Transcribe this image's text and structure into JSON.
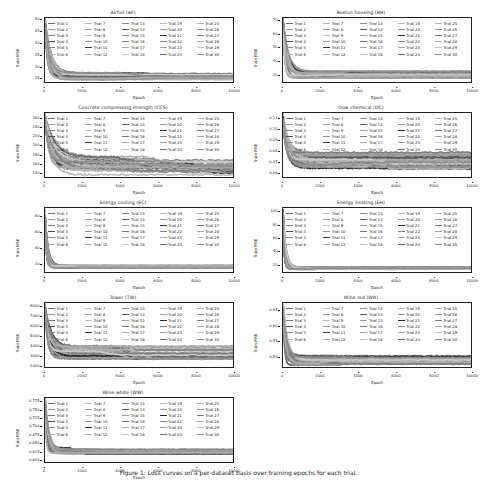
{
  "figure": {
    "caption": "Figure 1: Loss curves on a per-dataset basis over training epochs for each trial.",
    "xlabel": "Epoch",
    "ylabel": "Train MSE",
    "xticks": [
      "0",
      "2000",
      "4000",
      "6000",
      "8000",
      "10000"
    ],
    "xlim": [
      0,
      10000
    ],
    "legend_labels": [
      "Trial 1",
      "Trial 2",
      "Trial 3",
      "Trial 4",
      "Trial 5",
      "Trial 6",
      "Trial 7",
      "Trial 8",
      "Trial 9",
      "Trial 10",
      "Trial 11",
      "Trial 12",
      "Trial 13",
      "Trial 14",
      "Trial 15",
      "Trial 16",
      "Trial 17",
      "Trial 18",
      "Trial 19",
      "Trial 20",
      "Trial 21",
      "Trial 22",
      "Trial 23",
      "Trial 24",
      "Trial 25",
      "Trial 26",
      "Trial 27",
      "Trial 28",
      "Trial 29",
      "Trial 30"
    ],
    "legend_colors": [
      "#6b6b6b",
      "#9a9a9a",
      "#7d7d7d",
      "#4f4f4f",
      "#8c8c8c",
      "#aeaeae",
      "#b8b8b8",
      "#a0a0a0",
      "#c0c0c0",
      "#969696",
      "#3c3c3c",
      "#b0b0b0",
      "#8a8a8a",
      "#5a5a5a",
      "#9e9e9e",
      "#7a7a7a",
      "#a8a8a8",
      "#c4c4c4",
      "#bdbdbd",
      "#9b9b9b",
      "#2e2e2e",
      "#878787",
      "#a5a5a5",
      "#6f6f6f",
      "#b4b4b4",
      "#989898",
      "#7f7f7f",
      "#ababab",
      "#c8c8c8",
      "#8e8e8e"
    ]
  },
  "chart_data": [
    {
      "type": "line",
      "title": "Airfoil (AF)",
      "xlabel": "Epoch",
      "ylabel": "Train MSE",
      "xlim": [
        0,
        10000
      ],
      "ylim": [
        23,
        51
      ],
      "yticks": [
        "50",
        "45",
        "40",
        "35",
        "30",
        "25"
      ],
      "ytickvals": [
        50,
        45,
        40,
        35,
        30,
        25
      ],
      "grid": false,
      "legend_position": "upper center",
      "series_count": 30,
      "start_value": 50,
      "plateau_value": 25.5,
      "plateau_spread": 1.6,
      "decay_epochs": 180,
      "late_drop_epoch": 4200,
      "late_drop_value": 25.2
    },
    {
      "type": "line",
      "title": "Boston housing (BH)",
      "xlabel": "Epoch",
      "ylabel": "Train MSE",
      "xlim": [
        0,
        10000
      ],
      "ylim": [
        24,
        72
      ],
      "yticks": [
        "70",
        "60",
        "50",
        "40",
        "30"
      ],
      "ytickvals": [
        70,
        60,
        50,
        40,
        30
      ],
      "grid": false,
      "legend_position": "upper center",
      "series_count": 30,
      "start_value": 70,
      "plateau_value": 29.5,
      "plateau_spread": 2.5,
      "decay_epochs": 150,
      "late_drop_epoch": 3000,
      "late_drop_value": 28.5
    },
    {
      "type": "line",
      "title": "Concrete compressing strength (CCS)",
      "xlabel": "Epoch",
      "ylabel": "Train MSE",
      "xlim": [
        0,
        10000
      ],
      "ylim": [
        130,
        272
      ],
      "yticks": [
        "260",
        "240",
        "220",
        "200",
        "180",
        "160",
        "140"
      ],
      "ytickvals": [
        260,
        240,
        220,
        200,
        180,
        160,
        140
      ],
      "grid": false,
      "legend_position": "upper center",
      "series_count": 30,
      "start_value": 265,
      "plateau_value": 155,
      "plateau_spread": 22,
      "decay_epochs": 300,
      "late_drop_epoch": 5000,
      "late_drop_value": 148
    },
    {
      "type": "line",
      "title": "Dow chemical (DC)",
      "xlabel": "Epoch",
      "ylabel": "Train MSE",
      "xlim": [
        0,
        10000
      ],
      "ylim": [
        0.055,
        0.115
      ],
      "yticks": [
        "0.11",
        "0.10",
        "0.09",
        "0.08",
        "0.07",
        "0.06"
      ],
      "ytickvals": [
        0.11,
        0.1,
        0.09,
        0.08,
        0.07,
        0.06
      ],
      "grid": false,
      "legend_position": "upper center",
      "series_count": 30,
      "start_value": 0.112,
      "plateau_value": 0.07,
      "plateau_spread": 0.008,
      "decay_epochs": 200,
      "late_drop_epoch": 3200,
      "late_drop_value": 0.066
    },
    {
      "type": "line",
      "title": "Energy cooling (EC)",
      "xlabel": "Epoch",
      "ylabel": "Train MSE",
      "xlim": [
        0,
        10000
      ],
      "ylim": [
        8,
        92
      ],
      "yticks": [
        "80",
        "60",
        "40",
        "20"
      ],
      "ytickvals": [
        80,
        60,
        40,
        20
      ],
      "grid": false,
      "legend_position": "upper center",
      "series_count": 30,
      "start_value": 88,
      "plateau_value": 15,
      "plateau_spread": 2,
      "decay_epochs": 90,
      "late_drop_epoch": 1500,
      "late_drop_value": 14
    },
    {
      "type": "line",
      "title": "Energy heating (EH)",
      "xlabel": "Epoch",
      "ylabel": "Train MSE",
      "xlim": [
        0,
        10000
      ],
      "ylim": [
        8,
        106
      ],
      "yticks": [
        "100",
        "80",
        "60",
        "40",
        "20"
      ],
      "ytickvals": [
        100,
        80,
        60,
        40,
        20
      ],
      "grid": false,
      "legend_position": "upper center",
      "series_count": 30,
      "start_value": 102,
      "plateau_value": 14,
      "plateau_spread": 2,
      "decay_epochs": 90,
      "late_drop_epoch": 1200,
      "late_drop_value": 13
    },
    {
      "type": "line",
      "title": "Tower (TW)",
      "xlabel": "Epoch",
      "ylabel": "Train MSE",
      "xlim": [
        0,
        10000
      ],
      "ylim": [
        1800,
        8400
      ],
      "yticks": [
        "8000",
        "7000",
        "6000",
        "5000",
        "4000",
        "3000",
        "2000"
      ],
      "ytickvals": [
        8000,
        7000,
        6000,
        5000,
        4000,
        3000,
        2000
      ],
      "grid": false,
      "legend_position": "upper center",
      "series_count": 30,
      "start_value": 8200,
      "plateau_value": 3300,
      "plateau_spread": 700,
      "decay_epochs": 200,
      "late_drop_epoch": 3100,
      "late_drop_value": 2900
    },
    {
      "type": "line",
      "title": "Wine red (WR)",
      "xlabel": "Epoch",
      "ylabel": "Train MSE",
      "xlim": [
        0,
        10000
      ],
      "ylim": [
        0.465,
        0.675
      ],
      "yticks": [
        "0.65",
        "0.60",
        "0.55",
        "0.50"
      ],
      "ytickvals": [
        0.65,
        0.6,
        0.55,
        0.5
      ],
      "grid": false,
      "legend_position": "upper center",
      "series_count": 30,
      "start_value": 0.67,
      "plateau_value": 0.488,
      "plateau_spread": 0.018,
      "decay_epochs": 130,
      "late_drop_epoch": 2500,
      "late_drop_value": 0.482
    },
    {
      "type": "line",
      "title": "Wine white (WW)",
      "xlabel": "Epoch",
      "ylabel": "Train MSE",
      "xlim": [
        0,
        10000
      ],
      "ylim": [
        0.592,
        0.787
      ],
      "yticks": [
        "0.775",
        "0.750",
        "0.725",
        "0.700",
        "0.675",
        "0.650",
        "0.625",
        "0.600"
      ],
      "ytickvals": [
        0.775,
        0.75,
        0.725,
        0.7,
        0.675,
        0.65,
        0.625,
        0.6
      ],
      "grid": false,
      "legend_position": "upper center",
      "series_count": 30,
      "start_value": 0.782,
      "plateau_value": 0.626,
      "plateau_spread": 0.009,
      "decay_epochs": 120,
      "late_drop_epoch": 2200,
      "late_drop_value": 0.62
    }
  ]
}
